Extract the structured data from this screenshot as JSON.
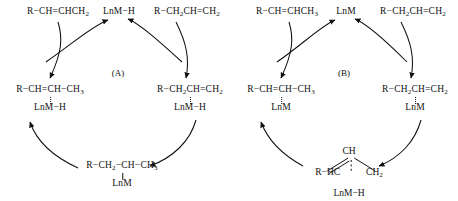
{
  "figure": {
    "background": "#ffffff",
    "ink": "#111111",
    "caption_a": "(A)",
    "caption_b": "(B)"
  },
  "cycle_a": {
    "label": "(A)",
    "species": {
      "top_left": {
        "formula_html": "R&minus;CH=CHCH<sub>2</sub>",
        "metal": ""
      },
      "top_mid": {
        "formula_html": "LnM&minus;H",
        "metal": ""
      },
      "top_right": {
        "formula_html": "R&minus;CH<sub>2</sub>CH=CH<sub>2</sub>",
        "metal": ""
      },
      "left": {
        "formula_html": "R&minus;CH=CH&minus;CH<sub>3</sub>",
        "metal": "LnM&minus;H",
        "bond": "dotted"
      },
      "right": {
        "formula_html": "R&minus;CH<sub>2</sub>CH=CH<sub>2</sub>",
        "metal": "LnM&minus;H",
        "bond": "dotted"
      },
      "bottom": {
        "formula_html": "R&minus;CH<sub>2</sub>&minus;CH&minus;CH<sub>3</sub>",
        "metal": "LnM",
        "bond": "solid"
      }
    }
  },
  "cycle_b": {
    "label": "(B)",
    "species": {
      "top_left": {
        "formula_html": "R&minus;CH=CHCH<sub>3</sub>",
        "metal": ""
      },
      "top_mid": {
        "formula_html": "LnM",
        "metal": ""
      },
      "top_right": {
        "formula_html": "R&minus;CH<sub>2</sub>CH=CH<sub>2</sub>",
        "metal": ""
      },
      "left": {
        "formula_html": "R&minus;CH=CH&minus;CH<sub>3</sub>",
        "metal": "LnM",
        "bond": "dotted"
      },
      "right": {
        "formula_html": "R&minus;CH<sub>2</sub>CH=CH<sub>2</sub>",
        "metal": "LnM",
        "bond": "dotted"
      },
      "bottom_allyl": {
        "apex_html": "CH",
        "left_html": "R&minus;HC",
        "right_html": "CH<sub>2</sub>",
        "metal": "LnM&minus;H"
      }
    }
  }
}
